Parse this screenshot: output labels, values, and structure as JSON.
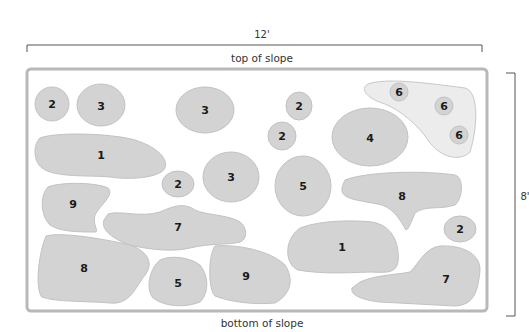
{
  "dimensions": {
    "width_label": "12'",
    "height_label": "8'"
  },
  "captions": {
    "top": "top of slope",
    "bottom": "bottom of slope"
  },
  "colors": {
    "plant_fill": "#d3d3d3",
    "plant_stroke": "#c2c2c2",
    "frame": "#b8b8b8",
    "light_area": "#ececec",
    "text": "#1a1a1a"
  },
  "plants": [
    {
      "id": "p1",
      "label": "2"
    },
    {
      "id": "p2",
      "label": "3"
    },
    {
      "id": "p3",
      "label": "3"
    },
    {
      "id": "p4",
      "label": "2"
    },
    {
      "id": "p5",
      "label": "2"
    },
    {
      "id": "p6",
      "label": "4"
    },
    {
      "id": "p7",
      "label": "6"
    },
    {
      "id": "p8",
      "label": "6"
    },
    {
      "id": "p9",
      "label": "6"
    },
    {
      "id": "p10",
      "label": "1"
    },
    {
      "id": "p11",
      "label": "2"
    },
    {
      "id": "p12",
      "label": "3"
    },
    {
      "id": "p13",
      "label": "5"
    },
    {
      "id": "p14",
      "label": "8"
    },
    {
      "id": "p15",
      "label": "9"
    },
    {
      "id": "p16",
      "label": "7"
    },
    {
      "id": "p17",
      "label": "2"
    },
    {
      "id": "p18",
      "label": "8"
    },
    {
      "id": "p19",
      "label": "5"
    },
    {
      "id": "p20",
      "label": "9"
    },
    {
      "id": "p21",
      "label": "1"
    },
    {
      "id": "p22",
      "label": "7"
    }
  ]
}
